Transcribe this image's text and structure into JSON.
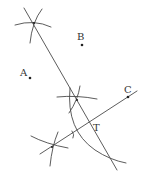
{
  "diagram": {
    "type": "geometric-construction",
    "points": [
      {
        "id": "A",
        "label": "A",
        "x": 30,
        "y": 78,
        "label_x": 20,
        "label_y": 76
      },
      {
        "id": "B",
        "label": "B",
        "x": 82,
        "y": 45,
        "label_x": 77,
        "label_y": 40
      },
      {
        "id": "C",
        "label": "C",
        "x": 128,
        "y": 97,
        "label_x": 124,
        "label_y": 93
      },
      {
        "id": "T",
        "label": "T",
        "x": 90,
        "y": 122,
        "label_x": 93,
        "label_y": 131
      }
    ],
    "labels": {
      "A": "A",
      "B": "B",
      "C": "C",
      "T": "T"
    },
    "construction_marks": [
      {
        "name": "top-arc-intersection",
        "x": 34,
        "y": 23
      },
      {
        "name": "middle-arc-intersection",
        "x": 77,
        "y": 100
      },
      {
        "name": "bottom-arc-intersection",
        "x": 52,
        "y": 147
      }
    ],
    "colors": {
      "stroke": "#4a4a4a",
      "point": "#222222",
      "text": "#333333",
      "background": "#ffffff"
    }
  }
}
